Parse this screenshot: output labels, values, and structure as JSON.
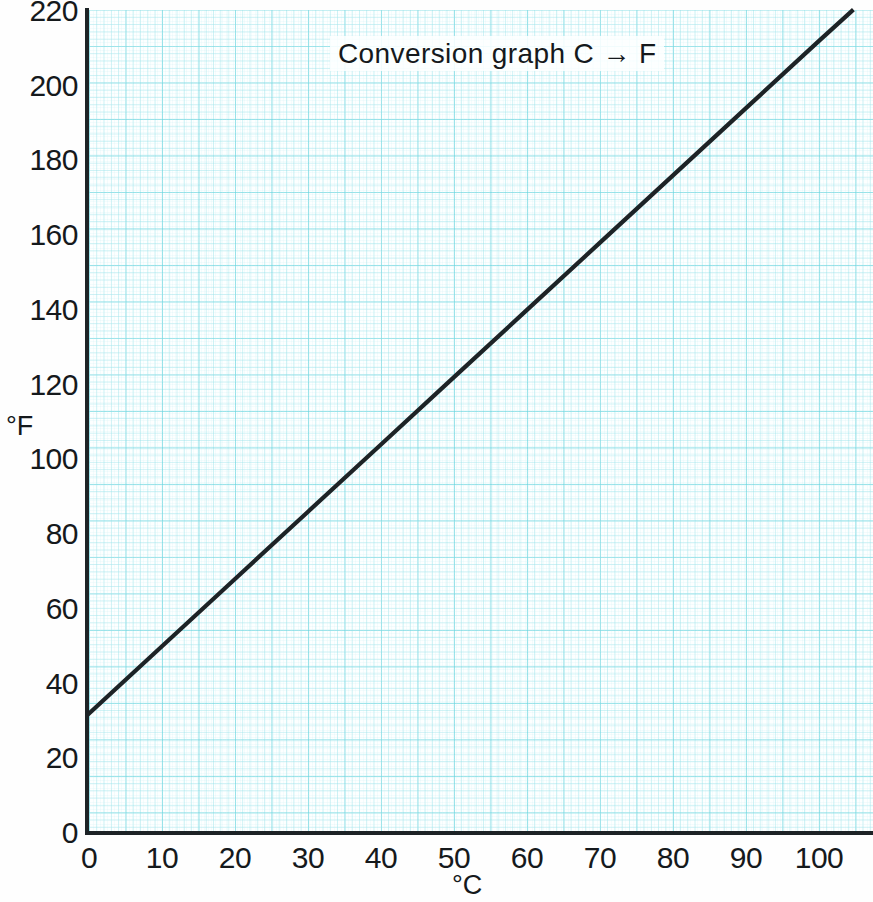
{
  "chart_data": {
    "type": "line",
    "title": "Conversion graph  C → F",
    "xlabel": "°C",
    "ylabel": "°F",
    "xlim": [
      0,
      105
    ],
    "ylim": [
      0,
      220
    ],
    "grid": true,
    "grid_style": "graph-paper",
    "grid_color": "#8ee0e8",
    "legend": "none",
    "line_color": "#1d2326",
    "line_width_px": 4,
    "relation": "F = 1.8 × C + 32",
    "xticks": [
      0,
      10,
      20,
      30,
      40,
      50,
      60,
      70,
      80,
      90,
      100
    ],
    "yticks": [
      0,
      20,
      40,
      60,
      80,
      100,
      120,
      140,
      160,
      180,
      200,
      220
    ],
    "xtick_labels": [
      "0",
      "10",
      "20",
      "30",
      "40",
      "50",
      "60",
      "70",
      "80",
      "90",
      "100"
    ],
    "ytick_labels": [
      "0",
      "20",
      "40",
      "60",
      "80",
      "100",
      "120",
      "140",
      "160",
      "180",
      "200",
      "220"
    ],
    "series": [
      {
        "name": "Celsius to Fahrenheit",
        "x": [
          0,
          10,
          20,
          30,
          40,
          50,
          60,
          70,
          80,
          90,
          100,
          104.5
        ],
        "values": [
          32,
          50,
          68,
          86,
          104,
          122,
          140,
          158,
          176,
          194,
          212,
          220
        ]
      }
    ],
    "annotations": []
  },
  "axes": {
    "y_label": "°F",
    "x_label": "°C"
  },
  "title": {
    "text": "Conversion graph  C → F"
  }
}
